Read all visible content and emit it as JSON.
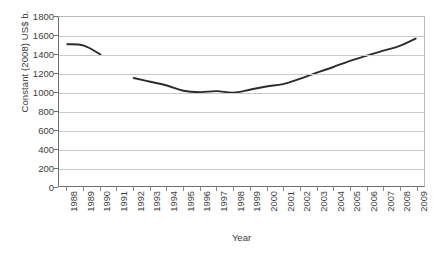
{
  "chart_data": {
    "type": "line",
    "title": "",
    "xlabel": "Year",
    "ylabel": "Constant (2008) US$ b.",
    "categories": [
      "1988",
      "1989",
      "1990",
      "1991",
      "1992",
      "1993",
      "1994",
      "1995",
      "1996",
      "1997",
      "1998",
      "1999",
      "2000",
      "2001",
      "2002",
      "2003",
      "2004",
      "2005",
      "2006",
      "2007",
      "2008",
      "2009"
    ],
    "values": [
      1510,
      1495,
      1400,
      null,
      1150,
      1110,
      1070,
      1015,
      1000,
      1010,
      995,
      1025,
      1060,
      1085,
      1140,
      1205,
      1265,
      1330,
      1385,
      1440,
      1490,
      1570
    ],
    "ylim": [
      0,
      1800
    ],
    "ytick_labels": [
      "1800",
      "1600",
      "1400",
      "1200",
      "1000",
      "800",
      "600",
      "400",
      "200",
      "0"
    ],
    "ytick_values": [
      1800,
      1600,
      1400,
      1200,
      1000,
      800,
      600,
      400,
      200,
      0
    ],
    "ystep": 200,
    "grid": true,
    "legend": false,
    "legend_position": "none",
    "series_color": "#2b2b2b",
    "gridline_color": "#c9c9c9",
    "axis_color": "#6e6e6e",
    "note_missing_years": [
      "1991"
    ]
  }
}
